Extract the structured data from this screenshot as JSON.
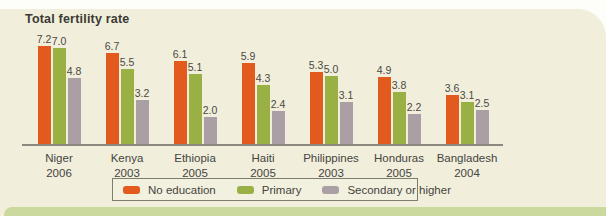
{
  "figure": {
    "title": "Total fertility rate"
  },
  "chart_data": {
    "type": "bar",
    "title": "Total fertility rate",
    "categories": [
      "Niger",
      "Kenya",
      "Ethiopia",
      "Haiti",
      "Philippines",
      "Honduras",
      "Bangladesh"
    ],
    "category_years": [
      "2006",
      "2003",
      "2005",
      "2005",
      "2003",
      "2005",
      "2004"
    ],
    "series": [
      {
        "name": "No education",
        "color": "#e35a1f",
        "values": [
          7.2,
          6.7,
          6.1,
          5.9,
          5.3,
          4.9,
          3.6
        ]
      },
      {
        "name": "Primary",
        "color": "#99b144",
        "values": [
          7.0,
          5.5,
          5.1,
          4.3,
          5.0,
          3.8,
          3.1
        ]
      },
      {
        "name": "Secondary or higher",
        "color": "#ab9fa6",
        "values": [
          4.8,
          3.2,
          2.0,
          2.4,
          3.1,
          2.2,
          2.5
        ]
      }
    ],
    "ylabel": "",
    "xlabel": "",
    "ylim": [
      0,
      7.5
    ],
    "value_labels_shown": true,
    "grid": false,
    "legend_position": "bottom"
  },
  "colors": {
    "panel_background": "#f1efdb",
    "page_background": "#fdfdfa",
    "bottom_strip": "#cbd99e",
    "axis_line": "#8b897f",
    "text": "#45443f",
    "series_no_education": "#e35a1f",
    "series_primary": "#99b144",
    "series_secondary_or_higher": "#ab9fa6"
  }
}
